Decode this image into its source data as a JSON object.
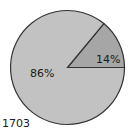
{
  "chart_data": {
    "type": "pie",
    "title": "",
    "slices": [
      {
        "label": "86%",
        "value": 86,
        "color": "#c2c2c2"
      },
      {
        "label": "14%",
        "value": 14,
        "color": "#a6a6a6"
      }
    ],
    "start_angle_deg": 0,
    "direction": "counterclockwise",
    "annotation": "1703",
    "legend": "none"
  },
  "labels": {
    "large_slice": "86%",
    "small_slice": "14%",
    "year": "1703"
  },
  "colors": {
    "large_slice": "#c2c2c2",
    "small_slice": "#a6a6a6",
    "outline": "#333333"
  }
}
